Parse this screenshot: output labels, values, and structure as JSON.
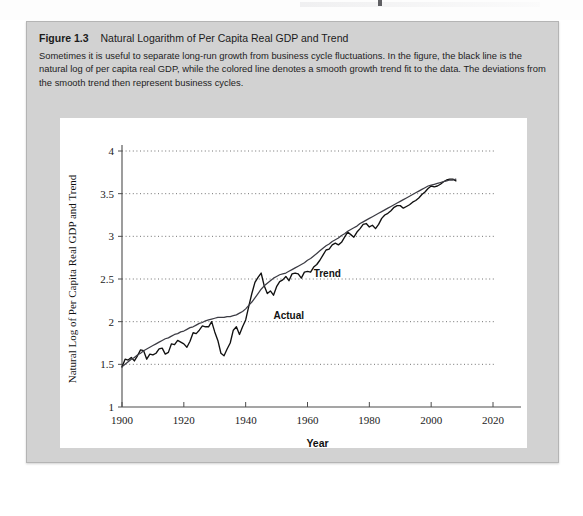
{
  "figure": {
    "label": "Figure 1.3",
    "title": "Natural Logarithm of Per Capita Real GDP and Trend",
    "caption": "Sometimes it is useful to separate long-run growth from business cycle fluctuations. In the figure, the black line is the natural log of per capita real GDP, while the colored line denotes a smooth growth trend fit to the data. The deviations from the smooth trend then represent business cycles."
  },
  "colors": {
    "panel_background": "#d2d2d2",
    "plot_background": "#ffffff",
    "actual_line": "#111111",
    "trend_line": "#3c3c44",
    "gridline": "#4a4a4a",
    "axis": "#4c4c4c"
  },
  "chart_data": {
    "type": "line",
    "title": "Natural Logarithm of Per Capita Real GDP and Trend",
    "xlabel": "Year",
    "ylabel": "Natural Log of Per Capita Real GDP and Trend",
    "xlim": [
      1900,
      2020
    ],
    "ylim": [
      1,
      4
    ],
    "xticks": [
      1900,
      1920,
      1940,
      1960,
      1980,
      2000,
      2020
    ],
    "yticks": [
      1,
      1.5,
      2,
      2.5,
      3,
      3.5,
      4
    ],
    "grid": "horizontal-dotted",
    "legend": "inline-annotations",
    "annotations": [
      {
        "text": "Actual",
        "year": 1949,
        "value": 2.03
      },
      {
        "text": "Trend",
        "year": 1962,
        "value": 2.52
      }
    ],
    "x": [
      1900,
      1901,
      1902,
      1903,
      1904,
      1905,
      1906,
      1907,
      1908,
      1909,
      1910,
      1911,
      1912,
      1913,
      1914,
      1915,
      1916,
      1917,
      1918,
      1919,
      1920,
      1921,
      1922,
      1923,
      1924,
      1925,
      1926,
      1927,
      1928,
      1929,
      1930,
      1931,
      1932,
      1933,
      1934,
      1935,
      1936,
      1937,
      1938,
      1939,
      1940,
      1941,
      1942,
      1943,
      1944,
      1945,
      1946,
      1947,
      1948,
      1949,
      1950,
      1951,
      1952,
      1953,
      1954,
      1955,
      1956,
      1957,
      1958,
      1959,
      1960,
      1961,
      1962,
      1963,
      1964,
      1965,
      1966,
      1967,
      1968,
      1969,
      1970,
      1971,
      1972,
      1973,
      1974,
      1975,
      1976,
      1977,
      1978,
      1979,
      1980,
      1981,
      1982,
      1983,
      1984,
      1985,
      1986,
      1987,
      1988,
      1989,
      1990,
      1991,
      1992,
      1993,
      1994,
      1995,
      1996,
      1997,
      1998,
      1999,
      2000,
      2001,
      2002,
      2003,
      2004,
      2005,
      2006,
      2007,
      2008
    ],
    "series": [
      {
        "name": "Actual",
        "color": "#111111",
        "values": [
          1.47,
          1.56,
          1.55,
          1.58,
          1.54,
          1.6,
          1.67,
          1.66,
          1.56,
          1.62,
          1.61,
          1.63,
          1.68,
          1.69,
          1.62,
          1.64,
          1.74,
          1.73,
          1.78,
          1.76,
          1.74,
          1.7,
          1.77,
          1.87,
          1.86,
          1.9,
          1.95,
          1.94,
          1.94,
          2.0,
          1.88,
          1.78,
          1.63,
          1.6,
          1.68,
          1.75,
          1.9,
          1.94,
          1.85,
          1.94,
          2.02,
          2.18,
          2.33,
          2.46,
          2.52,
          2.57,
          2.42,
          2.33,
          2.36,
          2.31,
          2.41,
          2.47,
          2.49,
          2.53,
          2.48,
          2.56,
          2.57,
          2.56,
          2.51,
          2.58,
          2.59,
          2.58,
          2.64,
          2.67,
          2.72,
          2.78,
          2.84,
          2.85,
          2.9,
          2.92,
          2.9,
          2.93,
          2.99,
          3.05,
          3.02,
          2.99,
          3.05,
          3.09,
          3.14,
          3.15,
          3.11,
          3.13,
          3.09,
          3.14,
          3.21,
          3.25,
          3.27,
          3.3,
          3.34,
          3.36,
          3.36,
          3.33,
          3.35,
          3.37,
          3.4,
          3.42,
          3.45,
          3.49,
          3.52,
          3.56,
          3.59,
          3.58,
          3.59,
          3.61,
          3.64,
          3.66,
          3.67,
          3.67,
          3.65
        ]
      },
      {
        "name": "Trend",
        "color": "#3c3c44",
        "values": [
          1.47,
          1.5,
          1.53,
          1.56,
          1.58,
          1.61,
          1.63,
          1.66,
          1.68,
          1.7,
          1.72,
          1.74,
          1.76,
          1.78,
          1.8,
          1.81,
          1.83,
          1.85,
          1.86,
          1.88,
          1.89,
          1.91,
          1.93,
          1.94,
          1.96,
          1.98,
          1.99,
          2.01,
          2.02,
          2.03,
          2.04,
          2.05,
          2.05,
          2.05,
          2.06,
          2.06,
          2.07,
          2.08,
          2.1,
          2.12,
          2.15,
          2.19,
          2.23,
          2.28,
          2.33,
          2.38,
          2.42,
          2.45,
          2.48,
          2.51,
          2.53,
          2.55,
          2.56,
          2.57,
          2.59,
          2.61,
          2.63,
          2.65,
          2.67,
          2.69,
          2.72,
          2.74,
          2.77,
          2.8,
          2.83,
          2.86,
          2.89,
          2.91,
          2.94,
          2.96,
          2.98,
          3.01,
          3.03,
          3.06,
          3.08,
          3.1,
          3.12,
          3.15,
          3.17,
          3.19,
          3.21,
          3.23,
          3.25,
          3.27,
          3.29,
          3.31,
          3.33,
          3.35,
          3.37,
          3.39,
          3.41,
          3.43,
          3.45,
          3.47,
          3.49,
          3.51,
          3.53,
          3.55,
          3.57,
          3.59,
          3.6,
          3.61,
          3.62,
          3.63,
          3.64,
          3.65,
          3.66,
          3.66,
          3.67
        ]
      }
    ]
  }
}
